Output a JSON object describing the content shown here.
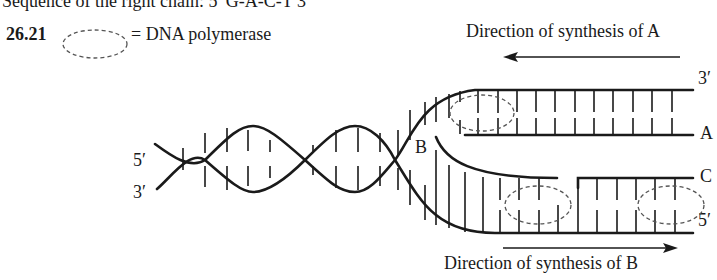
{
  "header": {
    "text": "Sequence of the right chain: 5′ G-A-C-T 3′"
  },
  "problem": {
    "number": "26.21",
    "legend_text": "= DNA polymerase",
    "legend_icon": "dashed-ellipse-icon"
  },
  "diagram": {
    "direction_a_label": "Direction of synthesis of A",
    "direction_b_label": "Direction of synthesis of B",
    "left_top_label": "5′",
    "left_bottom_label": "3′",
    "fork_label": "B",
    "right_labels": {
      "top": "3′",
      "strand_a": "A",
      "strand_c": "C",
      "bottom": "5′"
    },
    "stroke_color": "#1a1a1a",
    "polymerase_stroke_color": "#555555"
  }
}
